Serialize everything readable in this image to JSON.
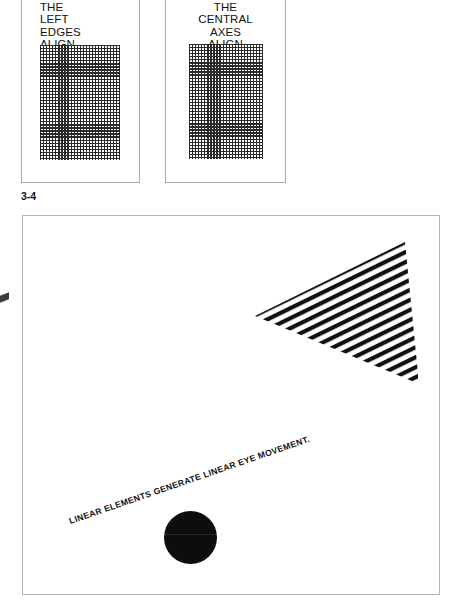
{
  "figure": {
    "number": "3-4"
  },
  "alignment_demo": {
    "panels": [
      {
        "name": "left-edges",
        "caption": "THE\nLEFT\nEDGES\nALIGN",
        "alignment": "left",
        "pattern": "fine-mesh-grid"
      },
      {
        "name": "central-axes",
        "caption": "THE\nCENTRAL\nAXES\nALIGN",
        "alignment": "center",
        "pattern": "fine-mesh-grid"
      }
    ]
  },
  "linear_figure": {
    "caption": "LINEAR ELEMENTS GENERATE LINEAR EYE MOVEMENT.",
    "shapes": {
      "triangle": "striped-triangle",
      "circle": "solid-black-circle"
    }
  },
  "colors": {
    "ink": "#111111",
    "grid_line": "#2b2b2b",
    "panel_border": "#a9a9ad",
    "figure_border": "#b4b4b8",
    "circle_fill": "#0d0d0d",
    "page_background": "#ffffff"
  }
}
